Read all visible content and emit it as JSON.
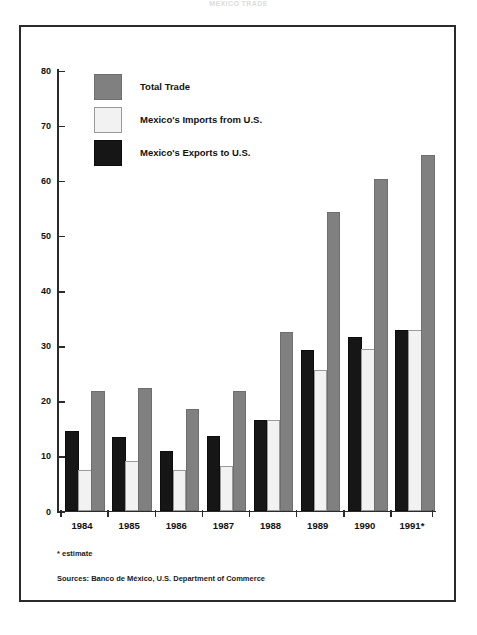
{
  "title": "MEXICO TRADE",
  "chart_data": {
    "type": "bar",
    "title": "",
    "xlabel": "",
    "ylabel": "",
    "ylim": [
      0,
      80
    ],
    "yticks": [
      0,
      10,
      20,
      30,
      40,
      50,
      60,
      70,
      80
    ],
    "grid": false,
    "legend_position": "top-left",
    "categories": [
      "1984",
      "1985",
      "1986",
      "1987",
      "1988",
      "1989",
      "1990",
      "1991*"
    ],
    "series": [
      {
        "name": "Mexico's Exports to U.S.",
        "color": "#161616",
        "values": [
          14.0,
          12.9,
          10.5,
          13.2,
          16.0,
          28.8,
          31.2,
          32.4
        ]
      },
      {
        "name": "Mexico's Imports from U.S.",
        "color": "#f2f2f2",
        "values": [
          7.0,
          8.6,
          7.0,
          7.8,
          16.0,
          25.2,
          28.9,
          32.4
        ]
      },
      {
        "name": "Total Trade",
        "color": "#808080",
        "values": [
          21.4,
          21.9,
          18.0,
          21.4,
          32.0,
          53.7,
          59.8,
          64.2
        ]
      }
    ]
  },
  "legend": {
    "items": [
      {
        "label": "Total Trade",
        "swatch": "total"
      },
      {
        "label": "Mexico's Imports from U.S.",
        "swatch": "imports"
      },
      {
        "label": "Mexico's Exports to U.S.",
        "swatch": "exports"
      }
    ]
  },
  "notes": {
    "footnote": "* estimate",
    "sources": "Sources: Banco de México, U.S. Department of Commerce"
  }
}
